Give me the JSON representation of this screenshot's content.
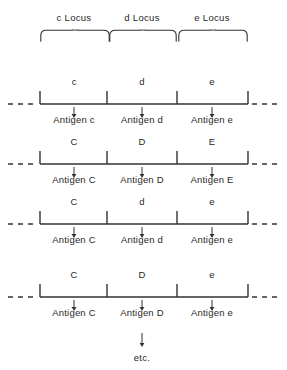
{
  "figure": {
    "background_color": "#ffffff",
    "ink_color": "#333333",
    "text_color": "#1f1f1f"
  },
  "loci": [
    {
      "label": "c Locus",
      "center_x": 74,
      "brace_left": 40,
      "brace_width": 70
    },
    {
      "label": "d Locus",
      "center_x": 142,
      "brace_left": 109,
      "brace_width": 68
    },
    {
      "label": "e Locus",
      "center_x": 212,
      "brace_left": 178,
      "brace_width": 70
    }
  ],
  "segments": {
    "ticks_x": [
      40,
      107,
      177,
      248
    ],
    "centers_x": [
      74,
      142,
      212
    ],
    "baseline_y": 28,
    "tick_height": 13,
    "dash_left": {
      "x": 8,
      "width": 28
    },
    "dash_right": {
      "x": 252,
      "width": 28
    }
  },
  "rows": [
    {
      "top": 76,
      "alleles": [
        "c",
        "d",
        "e"
      ],
      "antigens": [
        "Antigen c",
        "Antigen d",
        "Antigen e"
      ]
    },
    {
      "top": 136,
      "alleles": [
        "C",
        "D",
        "E"
      ],
      "antigens": [
        "Antigen C",
        "Antigen D",
        "Antigen E"
      ]
    },
    {
      "top": 196,
      "alleles": [
        "C",
        "d",
        "e"
      ],
      "antigens": [
        "Antigen C",
        "Antigen d",
        "Antigen e"
      ]
    },
    {
      "top": 269,
      "alleles": [
        "C",
        "D",
        "e"
      ],
      "antigens": [
        "Antigen C",
        "Antigen D",
        "Antigen e"
      ]
    }
  ],
  "footer": {
    "etc_label": "etc.",
    "etc_center_x": 142,
    "etc_label_top": 352,
    "arrow_top": 332,
    "arrow_height": 16
  }
}
